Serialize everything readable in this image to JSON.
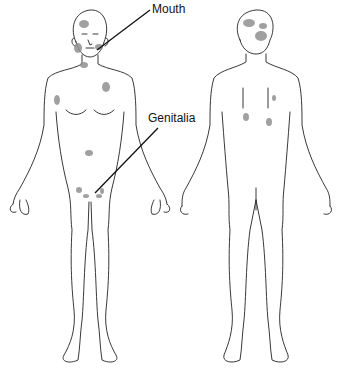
{
  "diagram": {
    "type": "anatomical body chart",
    "views": [
      "front",
      "back"
    ],
    "labels": [
      {
        "text": "Mouth",
        "x": 152,
        "y": 2
      },
      {
        "text": "Genitalia",
        "x": 148,
        "y": 111
      }
    ],
    "lesion_color": "#8f8f8f",
    "outline_color": "#222222",
    "front_lesions": [
      {
        "site": "scalp",
        "cx": 84,
        "cy": 24,
        "rx": 5,
        "ry": 4
      },
      {
        "site": "cheek",
        "cx": 78,
        "cy": 48,
        "rx": 4,
        "ry": 5
      },
      {
        "site": "chin/mouth",
        "cx": 99,
        "cy": 47,
        "rx": 4,
        "ry": 3
      },
      {
        "site": "neck",
        "cx": 84,
        "cy": 65,
        "rx": 4,
        "ry": 3
      },
      {
        "site": "left chest",
        "cx": 106,
        "cy": 87,
        "rx": 4,
        "ry": 5
      },
      {
        "site": "right axilla",
        "cx": 57,
        "cy": 100,
        "rx": 3,
        "ry": 5
      },
      {
        "site": "abdomen",
        "cx": 89,
        "cy": 153,
        "rx": 4,
        "ry": 3
      },
      {
        "site": "groin left",
        "cx": 79,
        "cy": 190,
        "rx": 3,
        "ry": 3
      },
      {
        "site": "genital 1",
        "cx": 86,
        "cy": 196,
        "rx": 3,
        "ry": 2
      },
      {
        "site": "genital 2",
        "cx": 99,
        "cy": 196,
        "rx": 3,
        "ry": 2
      },
      {
        "site": "groin right",
        "cx": 102,
        "cy": 191,
        "rx": 2,
        "ry": 3
      }
    ],
    "back_lesions": [
      {
        "site": "occiput 1",
        "cx": 249,
        "cy": 23,
        "rx": 6,
        "ry": 4
      },
      {
        "site": "occiput 2",
        "cx": 263,
        "cy": 26,
        "rx": 4,
        "ry": 3
      },
      {
        "site": "occiput 3",
        "cx": 261,
        "cy": 36,
        "rx": 6,
        "ry": 5
      },
      {
        "site": "upper back",
        "cx": 274,
        "cy": 98,
        "rx": 2,
        "ry": 3
      },
      {
        "site": "mid back left",
        "cx": 246,
        "cy": 117,
        "rx": 3,
        "ry": 4
      },
      {
        "site": "mid back right",
        "cx": 269,
        "cy": 122,
        "rx": 3,
        "ry": 4
      }
    ]
  }
}
